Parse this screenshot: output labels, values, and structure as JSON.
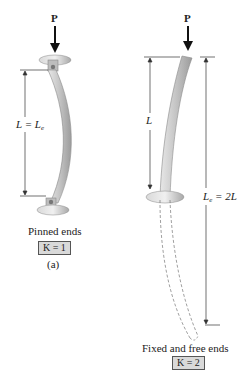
{
  "figure_a": {
    "load_label": "P",
    "length_label_main": "L = L",
    "length_label_sub": "e",
    "caption": "Pinned ends",
    "k_label": "K = 1",
    "part_label": "(a)"
  },
  "figure_b": {
    "load_label": "P",
    "length_label": "L",
    "effective_length_main": "L",
    "effective_length_sub": "e",
    "effective_length_rest": " = 2L",
    "caption": "Fixed and free ends",
    "k_label": "K = 2"
  },
  "colors": {
    "column_fill": "#c8c8c8",
    "column_shadow": "#9a9a9a",
    "dimension_line": "#333333",
    "k_box_fill": "#d9d9d9"
  }
}
